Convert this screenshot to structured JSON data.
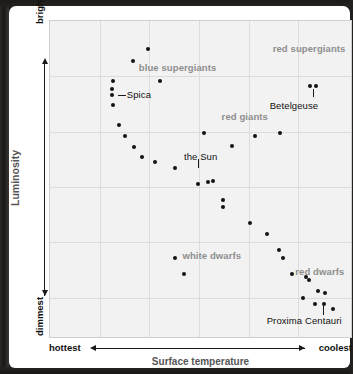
{
  "chart_data": {
    "type": "scatter",
    "xlabel": "Surface temperature",
    "ylabel": "Luminosity",
    "x_axis_left_label": "hottest",
    "x_axis_right_label": "coolest",
    "y_axis_top_label": "brightest",
    "y_axis_bottom_label": "dimmest",
    "grid": true,
    "x_gridline_fractions": [
      0.165,
      0.33,
      0.495,
      0.66,
      0.825
    ],
    "y_gridline_fractions": [
      0.175,
      0.35,
      0.525,
      0.7,
      0.875
    ],
    "xlim": [
      0,
      100
    ],
    "ylim": [
      0,
      100
    ],
    "point_color": "#131313",
    "grid_color": "#dcdcdc",
    "plot_background": "#f2f2f2",
    "category_label_color": "#8e8e8e",
    "points": [
      {
        "x": 27.5,
        "y": 87.5
      },
      {
        "x": 32.5,
        "y": 91.0
      },
      {
        "x": 21.0,
        "y": 81.0
      },
      {
        "x": 36.5,
        "y": 81.0
      },
      {
        "x": 20.5,
        "y": 78.5
      },
      {
        "x": 20.5,
        "y": 76.5
      },
      {
        "x": 21.0,
        "y": 73.5
      },
      {
        "x": 23.0,
        "y": 67.0
      },
      {
        "x": 25.0,
        "y": 63.5
      },
      {
        "x": 28.0,
        "y": 60.0
      },
      {
        "x": 30.5,
        "y": 57.0
      },
      {
        "x": 35.0,
        "y": 55.5
      },
      {
        "x": 41.5,
        "y": 53.5
      },
      {
        "x": 49.0,
        "y": 48.5
      },
      {
        "x": 52.5,
        "y": 49.0
      },
      {
        "x": 54.0,
        "y": 49.5
      },
      {
        "x": 57.5,
        "y": 43.5
      },
      {
        "x": 57.5,
        "y": 41.0
      },
      {
        "x": 66.5,
        "y": 36.0
      },
      {
        "x": 72.0,
        "y": 32.5
      },
      {
        "x": 76.0,
        "y": 27.5
      },
      {
        "x": 77.5,
        "y": 25.0
      },
      {
        "x": 51.0,
        "y": 64.5
      },
      {
        "x": 60.5,
        "y": 60.5
      },
      {
        "x": 68.0,
        "y": 63.5
      },
      {
        "x": 76.5,
        "y": 64.5
      },
      {
        "x": 86.5,
        "y": 79.5
      },
      {
        "x": 88.5,
        "y": 79.5
      },
      {
        "x": 41.5,
        "y": 25.0
      },
      {
        "x": 44.5,
        "y": 20.0
      },
      {
        "x": 80.5,
        "y": 20.0
      },
      {
        "x": 85.0,
        "y": 19.0
      },
      {
        "x": 86.0,
        "y": 18.0
      },
      {
        "x": 89.0,
        "y": 14.5
      },
      {
        "x": 91.5,
        "y": 14.0
      },
      {
        "x": 84.0,
        "y": 12.5
      },
      {
        "x": 88.0,
        "y": 10.5
      },
      {
        "x": 91.0,
        "y": 10.5
      },
      {
        "x": 94.0,
        "y": 9.0
      }
    ],
    "category_labels": [
      {
        "text": "blue supergiants",
        "x": 29.5,
        "y": 85.0
      },
      {
        "text": "red supergiants",
        "x": 74.0,
        "y": 91.0
      },
      {
        "text": "red giants",
        "x": 57.0,
        "y": 69.5
      },
      {
        "text": "white dwarfs",
        "x": 44.0,
        "y": 25.5
      },
      {
        "text": "red dwarfs",
        "x": 81.5,
        "y": 20.5
      }
    ],
    "star_labels": [
      {
        "text": "Spica",
        "x": 25.5,
        "y": 76.5
      },
      {
        "text": "Betelgeuse",
        "x": 73.0,
        "y": 73.0
      },
      {
        "text": "the Sun",
        "x": 44.5,
        "y": 57.0
      },
      {
        "text": "Proxima Centauri",
        "x": 72.0,
        "y": 5.0
      }
    ]
  }
}
